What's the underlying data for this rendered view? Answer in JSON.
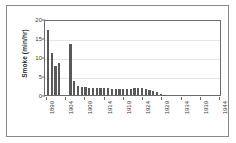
{
  "chart_data": {
    "type": "bar",
    "title": "",
    "subtitle": "",
    "xlabel": "",
    "ylabel": "Smoke (min/hr)",
    "ylim": [
      0,
      20
    ],
    "yticks": [
      0,
      5,
      10,
      15,
      20
    ],
    "ytick_labels": [
      "0",
      "5",
      "10",
      "15",
      "20"
    ],
    "grid": true,
    "grid_axis": "y",
    "legend": false,
    "legend_position": "none",
    "bar_color": "#595959",
    "axis_color": "#6b6b6b",
    "gridline_color": "#e6e6e6",
    "background_color": "#ffffff",
    "xtick_labels": [
      "1899",
      "1904",
      "1909",
      "1914",
      "1919",
      "1924",
      "1929",
      "1934",
      "1939",
      "1944"
    ],
    "xtick_interval_years": 5,
    "categories": [
      "1899",
      "1900",
      "1901",
      "1902",
      "1903",
      "1904",
      "1905",
      "1906",
      "1907",
      "1908",
      "1909",
      "1910",
      "1911",
      "1912",
      "1913",
      "1914",
      "1915",
      "1916",
      "1917",
      "1918",
      "1919",
      "1920",
      "1921",
      "1922",
      "1923",
      "1924",
      "1925",
      "1926",
      "1927",
      "1928",
      "1929",
      "1930",
      "1931",
      "1932",
      "1933",
      "1934",
      "1935",
      "1936",
      "1937",
      "1938",
      "1939",
      "1940",
      "1941",
      "1942",
      "1943",
      "1944"
    ],
    "values": [
      17.1,
      11.1,
      7.7,
      8.3,
      0,
      0,
      13.4,
      3.7,
      2.4,
      2.1,
      2.0,
      1.9,
      1.9,
      1.9,
      1.8,
      1.8,
      1.8,
      1.7,
      1.6,
      1.5,
      1.5,
      1.5,
      1.6,
      1.8,
      1.9,
      1.9,
      1.7,
      1.4,
      1.1,
      0.7,
      0.3,
      0.1,
      0,
      0,
      0,
      0,
      0,
      0,
      0,
      0,
      0,
      0,
      0,
      0,
      0,
      0
    ]
  }
}
